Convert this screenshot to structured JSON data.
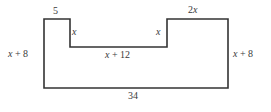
{
  "figure": {
    "kind": "geometry-polygon-diagram",
    "stroke_color": "#333333",
    "background_color": "#ffffff",
    "label_color": "#3a3a3a"
  },
  "labels": {
    "top_left_step": "5",
    "top_right_step": {
      "coefficient": "2",
      "variable": "x"
    },
    "inner_left_depth": "x",
    "inner_right_depth": "x",
    "notch_floor": {
      "variable": "x",
      "operator": "+",
      "constant": "12"
    },
    "left_side": {
      "variable": "x",
      "operator": "+",
      "constant": "8"
    },
    "right_side": {
      "variable": "x",
      "operator": "+",
      "constant": "8"
    },
    "bottom_side": "34"
  },
  "geometry": {
    "points": "44,19 70,19 70,47 167,47 167,19 228,19 228,88 44,88",
    "vertices": [
      [
        44,
        19
      ],
      [
        70,
        19
      ],
      [
        70,
        47
      ],
      [
        167,
        47
      ],
      [
        167,
        19
      ],
      [
        228,
        19
      ],
      [
        228,
        88
      ],
      [
        44,
        88
      ]
    ]
  }
}
